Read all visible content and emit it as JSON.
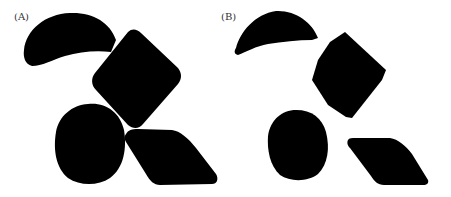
{
  "figure": {
    "panels": [
      {
        "label": "(A)",
        "description": "Four overlapping/touching black shapes: crescent, rounded diamond, round blob, leaf/rhombus"
      },
      {
        "label": "(B)",
        "description": "Same four black shapes, separated/segmented"
      }
    ],
    "colors": {
      "shape_fill": "#000000",
      "background": "#ffffff",
      "label_text": "#333333"
    }
  }
}
